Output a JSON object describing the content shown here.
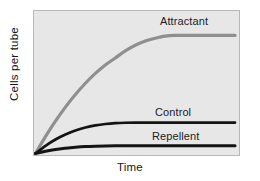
{
  "chart_data": {
    "type": "line",
    "title": "",
    "xlabel": "Time",
    "ylabel": "Cells per tube",
    "grid": false,
    "legend_position": "inline-right-of-curve",
    "axis_ticks": {
      "x": [],
      "y": []
    },
    "xlim": [
      0,
      100
    ],
    "ylim": [
      0,
      100
    ],
    "x": [
      0,
      5,
      10,
      15,
      20,
      25,
      30,
      35,
      40,
      45,
      50,
      55,
      60,
      65,
      70,
      75,
      80,
      85,
      90,
      95,
      100
    ],
    "series": [
      {
        "name": "Attractant",
        "color": "#8f8f8f",
        "label": "Attractant",
        "plateau_value": 84,
        "values": [
          0,
          12,
          23,
          33,
          42,
          50,
          57,
          63,
          68,
          73,
          77,
          80,
          82,
          83.5,
          84,
          84,
          84,
          84,
          84,
          84,
          84
        ]
      },
      {
        "name": "Control",
        "color": "#141414",
        "label": "Control",
        "plateau_value": 22,
        "values": [
          0,
          5.5,
          10,
          13.5,
          16.4,
          18.5,
          20,
          21,
          21.6,
          21.9,
          22,
          22,
          22,
          22,
          22,
          22,
          22,
          22,
          22,
          22,
          22
        ]
      },
      {
        "name": "Repellent",
        "color": "#141414",
        "label": "Repellent",
        "plateau_value": 5.5,
        "values": [
          0,
          1.6,
          2.9,
          3.8,
          4.5,
          5.0,
          5.25,
          5.4,
          5.5,
          5.5,
          5.5,
          5.5,
          5.5,
          5.5,
          5.5,
          5.5,
          5.5,
          5.5,
          5.5,
          5.5,
          5.5
        ]
      }
    ],
    "colors": {
      "panel_background": "#e7e7e7",
      "panel_border": "#b9b9b9",
      "figure_background": "#ffffff",
      "attractant": "#8f8f8f",
      "control": "#141414",
      "repellent": "#141414",
      "text": "#151515"
    }
  },
  "axes": {
    "y_title": "Cells per tube",
    "x_title": "Time"
  },
  "labels": {
    "attractant": "Attractant",
    "control": "Control",
    "repellent": "Repellent"
  }
}
